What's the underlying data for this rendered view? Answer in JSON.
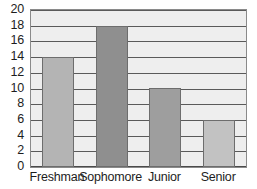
{
  "chart_data": {
    "type": "bar",
    "title": "",
    "xlabel": "",
    "ylabel": "",
    "categories": [
      "Freshman",
      "Sophomore",
      "Junior",
      "Senior"
    ],
    "values": [
      14,
      18,
      10,
      6
    ],
    "bar_colors": [
      "#b4b4b4",
      "#8f8f8f",
      "#9e9e9e",
      "#c2c2c2"
    ],
    "ylim": [
      0,
      20
    ],
    "ytick_labels": [
      "0",
      "2",
      "4",
      "6",
      "8",
      "10",
      "12",
      "14",
      "16",
      "18",
      "20"
    ],
    "ytick_values": [
      0,
      2,
      4,
      6,
      8,
      10,
      12,
      14,
      16,
      18,
      20
    ],
    "grid": true,
    "legend": false,
    "plot_background": "#eeeeee",
    "gridline_color": "#5a5a5a",
    "frame_color": "#8a8a8a",
    "text_color": "#1d1d1d"
  }
}
